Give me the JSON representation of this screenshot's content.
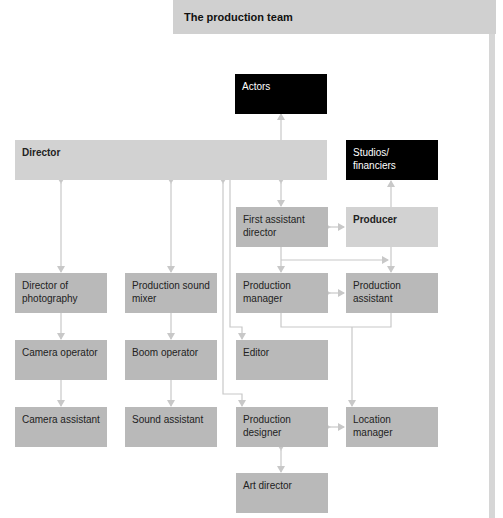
{
  "header": {
    "title": "The production team"
  },
  "colors": {
    "node": "#b9b9b9",
    "node_light": "#d2d2d2",
    "node_dark": "#000000",
    "line": "#c8c8c8",
    "header_bg": "#d0d0d0"
  },
  "nodes": {
    "actors": "Actors",
    "director": "Director",
    "studios": "Studios/ financiers",
    "first_ad": "First assistant director",
    "producer": "Producer",
    "dop": "Director of photography",
    "sound_mixer": "Production sound mixer",
    "prod_manager": "Production manager",
    "prod_assistant": "Production assistant",
    "camera_operator": "Camera operator",
    "boom_operator": "Boom operator",
    "editor": "Editor",
    "camera_assistant": "Camera assistant",
    "sound_assistant": "Sound assistant",
    "prod_designer": "Production designer",
    "location_manager": "Location manager",
    "art_director": "Art director"
  },
  "edges": [
    [
      "director",
      "actors"
    ],
    [
      "producer",
      "studios"
    ],
    [
      "director",
      "first_ad",
      "both"
    ],
    [
      "first_ad",
      "producer",
      "both"
    ],
    [
      "director",
      "dop",
      "both"
    ],
    [
      "director",
      "sound_mixer",
      "both"
    ],
    [
      "first_ad",
      "prod_manager"
    ],
    [
      "first_ad",
      "prod_assistant"
    ],
    [
      "producer",
      "prod_assistant"
    ],
    [
      "prod_manager",
      "prod_assistant",
      "both"
    ],
    [
      "dop",
      "camera_operator"
    ],
    [
      "camera_operator",
      "camera_assistant"
    ],
    [
      "sound_mixer",
      "boom_operator"
    ],
    [
      "boom_operator",
      "sound_assistant"
    ],
    [
      "director",
      "editor"
    ],
    [
      "director",
      "prod_designer",
      "both"
    ],
    [
      "prod_manager",
      "location_manager"
    ],
    [
      "prod_assistant",
      "location_manager"
    ],
    [
      "prod_designer",
      "location_manager",
      "both"
    ],
    [
      "prod_designer",
      "art_director",
      "both"
    ]
  ]
}
